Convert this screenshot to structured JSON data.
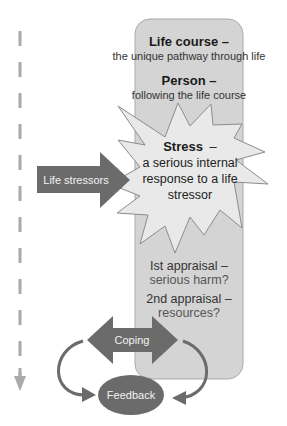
{
  "colors": {
    "box_fill": "#d4d4d4",
    "box_stroke": "#a9a9a9",
    "starburst_fill": "#e9e9e9",
    "starburst_stroke": "#8c8c8c",
    "dark_arrow": "#6b6b6b",
    "feedback_fill": "#6b6b6b",
    "dashed_line": "#aaaaaa"
  },
  "life_course": {
    "title": "Life course –",
    "subtitle": "the unique pathway through life"
  },
  "person": {
    "title": "Person –",
    "subtitle": "following the life course"
  },
  "stress": {
    "title": "Stress",
    "title_dash": "–",
    "line1": "a serious internal",
    "line2": "response to a life",
    "line3": "stressor"
  },
  "life_stressors": {
    "label": "Life stressors"
  },
  "first_appraisal": {
    "title": "Ist appraisal –",
    "subtitle": "serious harm?"
  },
  "second_appraisal": {
    "title": "2nd appraisal –",
    "subtitle": "resources?"
  },
  "coping": {
    "label": "Coping"
  },
  "feedback": {
    "label": "Feedback"
  },
  "timeline": {
    "direction": "down"
  }
}
